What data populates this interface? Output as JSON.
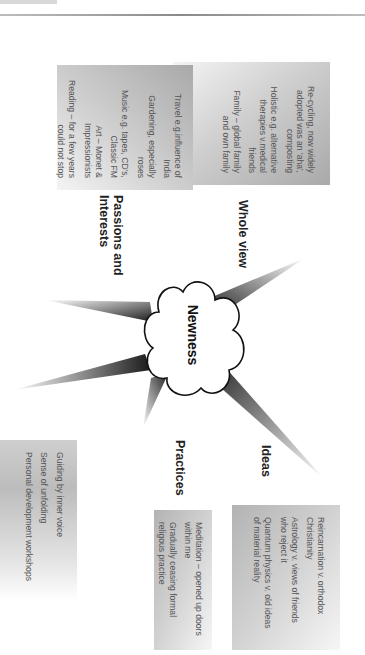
{
  "diagram": {
    "title": "Newness",
    "orientation": "rotated 90 degrees clockwise",
    "central_node": {
      "label": "Newness",
      "shape": "cloud"
    },
    "branches": [
      {
        "id": "whole-view",
        "label": "Whole view",
        "items": [
          "Re-cycling, now widely adopted was an 'aha', composting",
          "Holistic e.g. alternative therapies v.medical friends",
          "Family – global family and own family"
        ]
      },
      {
        "id": "passions-and-interests",
        "label": "Passions and Interests",
        "items": [
          "Travel e.g.influence of India",
          "Gardening, especially roses",
          "Music e.g. tapes, CD's, Classic FM",
          "Art – Monet & Impressionists",
          "Reading – for a few years could not stop"
        ]
      },
      {
        "id": "ideas",
        "label": "Ideas",
        "items": [
          "Reincarnation v. orthodox Christianity",
          "Astrology v. views of friends who reject it",
          "Quantum physics v. old ideas of material reality"
        ]
      },
      {
        "id": "practices",
        "label": "Practices",
        "items": [
          "Meditation – opened up doors within me",
          "Gradually ceasing formal religous practice"
        ]
      },
      {
        "id": "self",
        "label": "Self",
        "items": [
          "Guiding by inner voice",
          "Sense of unfolding",
          "Personal development workshops"
        ]
      }
    ]
  },
  "colors": {
    "spoke_dark": "#1a1a1a",
    "spoke_light": "#ffffff",
    "box_gray": "#b5b5b5",
    "text_dark": "#222222",
    "text_body": "#555555"
  }
}
